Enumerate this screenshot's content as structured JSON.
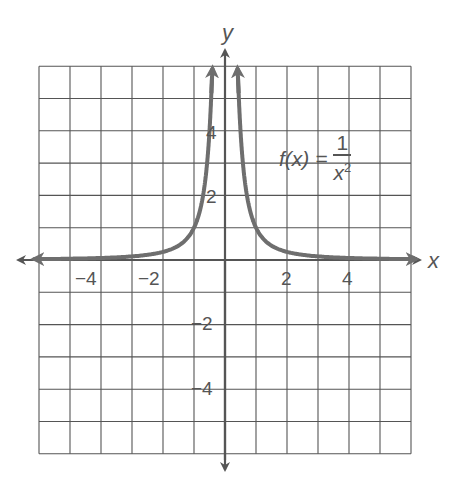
{
  "chart_data": {
    "type": "line",
    "title": "",
    "function_label": {
      "lhs": "f(x) =",
      "numerator": "1",
      "denominator_base": "x",
      "denominator_exp": "2"
    },
    "xlabel": "x",
    "ylabel": "y",
    "xlim": [
      -6,
      6
    ],
    "ylim": [
      -6,
      6
    ],
    "grid": true,
    "grid_step": 1,
    "x_ticks": [
      {
        "value": -4,
        "label": "−4"
      },
      {
        "value": -2,
        "label": "−2"
      },
      {
        "value": 2,
        "label": "2"
      },
      {
        "value": 4,
        "label": "4"
      }
    ],
    "y_ticks": [
      {
        "value": 4,
        "label": "4"
      },
      {
        "value": 2,
        "label": "2"
      },
      {
        "value": -2,
        "label": "−2"
      },
      {
        "value": -4,
        "label": "−4"
      }
    ],
    "series": [
      {
        "name": "f(x) = 1/x^2",
        "branches": [
          {
            "x": [
              -6,
              -5,
              -4,
              -3,
              -2,
              -1.5,
              -1,
              -0.75,
              -0.6,
              -0.5,
              -0.45,
              -0.41
            ],
            "y": [
              0.028,
              0.04,
              0.063,
              0.111,
              0.25,
              0.444,
              1,
              1.778,
              2.778,
              4,
              4.938,
              5.95
            ]
          },
          {
            "x": [
              0.41,
              0.45,
              0.5,
              0.6,
              0.75,
              1,
              1.5,
              2,
              3,
              4,
              5,
              6
            ],
            "y": [
              5.95,
              4.938,
              4,
              2.778,
              1.778,
              1,
              0.444,
              0.25,
              0.111,
              0.063,
              0.04,
              0.028
            ]
          }
        ],
        "color": "#6e6e6e"
      }
    ]
  },
  "colors": {
    "grid": "#555555",
    "axis": "#555555",
    "curve": "#6e6e6e",
    "text": "#555555"
  }
}
